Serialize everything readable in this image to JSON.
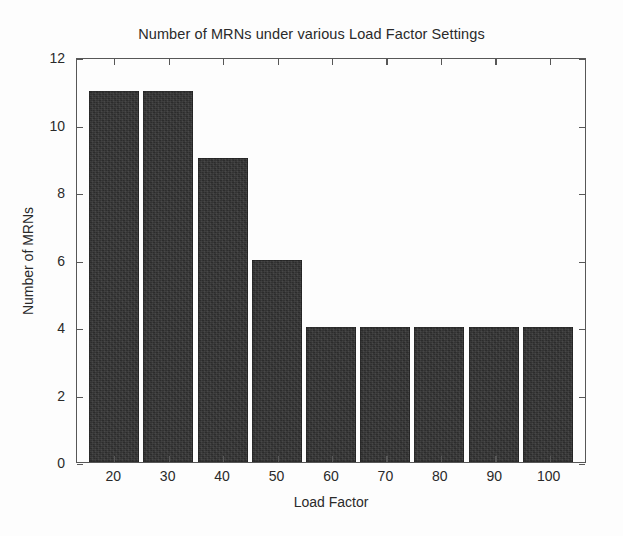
{
  "chart_data": {
    "type": "bar",
    "title": "Number of MRNs under various Load Factor Settings",
    "xlabel": "Load Factor",
    "ylabel": "Number of MRNs",
    "categories": [
      "20",
      "30",
      "40",
      "50",
      "60",
      "70",
      "80",
      "90",
      "100"
    ],
    "values": [
      11,
      11,
      9,
      6,
      4,
      4,
      4,
      4,
      4
    ],
    "ylim": [
      0,
      12
    ],
    "y_ticks": [
      "0",
      "2",
      "4",
      "6",
      "8",
      "10",
      "12"
    ],
    "y_tick_values": [
      0,
      2,
      4,
      6,
      8,
      10,
      12
    ],
    "grid": false,
    "legend": null,
    "bar_color": "#2c2c2c",
    "axis_color": "#575757",
    "background_color": "#fdfdfd"
  }
}
